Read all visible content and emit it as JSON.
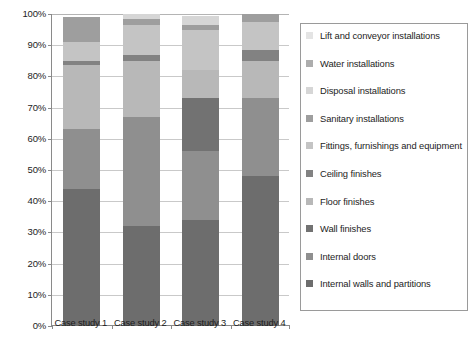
{
  "chart_data": {
    "type": "bar",
    "subtype": "stacked-percentage-column",
    "title": "",
    "subtitle": "",
    "xlabel": "",
    "ylabel": "",
    "categories": [
      "Case study 1",
      "Case study 2",
      "Case study 3",
      "Case study 4"
    ],
    "ylim": [
      0,
      100
    ],
    "ytick_labels": [
      "0%",
      "10%",
      "20%",
      "30%",
      "40%",
      "50%",
      "60%",
      "70%",
      "80%",
      "90%",
      "100%"
    ],
    "ytick_values": [
      0,
      10,
      20,
      30,
      40,
      50,
      60,
      70,
      80,
      90,
      100
    ],
    "grid": true,
    "grid_axis": "y",
    "legend_position": "right",
    "legend_order": "reversed-stack-top-first",
    "value_unit": "%",
    "series": [
      {
        "name": "Internal walls and partitions",
        "color": "#6d6d6d",
        "values": [
          44.0,
          32.0,
          34.0,
          48.0
        ]
      },
      {
        "name": "Internal doors",
        "color": "#8f8f8f",
        "values": [
          19.0,
          35.0,
          22.0,
          25.0
        ]
      },
      {
        "name": "Wall finishes",
        "color": "#727272",
        "values": [
          0.0,
          0.0,
          17.0,
          0.0
        ]
      },
      {
        "name": "Floor finishes",
        "color": "#b8b8b8",
        "values": [
          20.5,
          18.0,
          9.0,
          12.0
        ]
      },
      {
        "name": "Ceiling finishes",
        "color": "#828282",
        "values": [
          1.5,
          2.0,
          0.0,
          3.5
        ]
      },
      {
        "name": "Fittings, furnishings and equipment",
        "color": "#c4c4c4",
        "values": [
          6.0,
          9.5,
          13.0,
          9.0
        ]
      },
      {
        "name": "Sanitary installations",
        "color": "#9e9e9e",
        "values": [
          8.0,
          2.0,
          1.5,
          2.5
        ]
      },
      {
        "name": "Disposal installations",
        "color": "#d6d6d6",
        "values": [
          0.0,
          1.5,
          3.0,
          0.0
        ]
      },
      {
        "name": "Water installations",
        "color": "#adadad",
        "values": [
          0.0,
          0.0,
          0.0,
          0.0
        ]
      },
      {
        "name": "Lift and conveyor installations",
        "color": "#e4e4e4",
        "values": [
          0.0,
          0.0,
          0.0,
          0.0
        ]
      }
    ],
    "stack_tops": {
      "Case study 1": [
        44.0,
        63.0,
        63.0,
        83.5,
        85.0,
        91.0,
        99.0,
        99.0,
        99.0,
        99.0
      ],
      "Case study 2": [
        32.0,
        67.0,
        67.0,
        85.0,
        87.0,
        96.5,
        98.5,
        100.0,
        100.0,
        100.0
      ],
      "Case study 3": [
        34.0,
        56.0,
        73.0,
        82.0,
        82.0,
        95.0,
        96.5,
        99.5,
        99.5,
        99.5
      ],
      "Case study 4": [
        48.0,
        73.0,
        73.0,
        85.0,
        88.5,
        97.5,
        100.0,
        100.0,
        100.0,
        100.0
      ]
    }
  },
  "legend": {
    "items": [
      {
        "label": "Lift and conveyor installations",
        "color": "#e4e4e4"
      },
      {
        "label": "Water installations",
        "color": "#adadad"
      },
      {
        "label": "Disposal installations",
        "color": "#d6d6d6"
      },
      {
        "label": "Sanitary installations",
        "color": "#9e9e9e"
      },
      {
        "label": "Fittings, furnishings and equipment",
        "color": "#c4c4c4"
      },
      {
        "label": "Ceiling finishes",
        "color": "#828282"
      },
      {
        "label": "Floor finishes",
        "color": "#b8b8b8"
      },
      {
        "label": "Wall finishes",
        "color": "#727272"
      },
      {
        "label": "Internal doors",
        "color": "#8f8f8f"
      },
      {
        "label": "Internal walls and partitions",
        "color": "#6d6d6d"
      }
    ]
  },
  "colors": {
    "axis": "#8a8a8a",
    "gridline": "#c9c9c9",
    "legend_border": "#9a9a9a",
    "text": "#1d1d1d",
    "background": "#ffffff"
  }
}
